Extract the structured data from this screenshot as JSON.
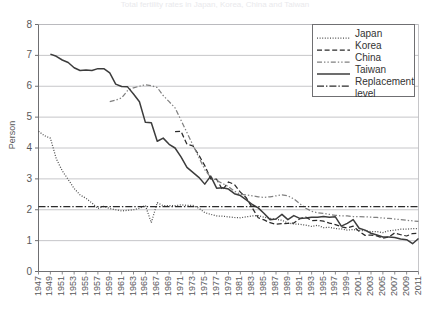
{
  "title": "Total fertility rates in Japan, Korea, China and Taiwan",
  "axes": {
    "ylabel": "Person",
    "yticks": [
      "0",
      "1",
      "2",
      "3",
      "4",
      "5",
      "6",
      "7",
      "8"
    ],
    "ylim": [
      0,
      8
    ],
    "xlim": [
      1947,
      2011
    ],
    "xticks": [
      "1947",
      "1949",
      "1951",
      "1953",
      "1955",
      "1957",
      "1959",
      "1961",
      "1963",
      "1965",
      "1967",
      "1969",
      "1971",
      "1973",
      "1975",
      "1977",
      "1979",
      "1981",
      "1983",
      "1985",
      "1987",
      "1989",
      "1991",
      "1993",
      "1995",
      "1997",
      "1999",
      "2001",
      "2003",
      "2005",
      "2007",
      "2009",
      "2011"
    ]
  },
  "legend": {
    "position": "top-right",
    "entries": [
      {
        "label": "Japan",
        "style": "dotted",
        "color": "#4d4d4d"
      },
      {
        "label": "Korea",
        "style": "dashed",
        "color": "#2b2b2b"
      },
      {
        "label": "China",
        "style": "dashdotdot",
        "color": "#808080"
      },
      {
        "label": "Taiwan",
        "style": "solid",
        "color": "#3c3c3c"
      },
      {
        "label": "Replacement",
        "style": "dashdot",
        "color": "#2b2b2b"
      }
    ],
    "continuation": "level"
  },
  "chart_data": {
    "type": "line",
    "title": "Total fertility rates in Japan, Korea, China and Taiwan",
    "xlabel": "",
    "ylabel": "Person",
    "ylim": [
      0,
      8
    ],
    "xlim": [
      1947,
      2011
    ],
    "grid": true,
    "legend_position": "top-right",
    "x": [
      1947,
      1948,
      1949,
      1950,
      1951,
      1952,
      1953,
      1954,
      1955,
      1956,
      1957,
      1958,
      1959,
      1960,
      1961,
      1962,
      1963,
      1964,
      1965,
      1966,
      1967,
      1968,
      1969,
      1970,
      1971,
      1972,
      1973,
      1974,
      1975,
      1976,
      1977,
      1978,
      1979,
      1980,
      1981,
      1982,
      1983,
      1984,
      1985,
      1986,
      1987,
      1988,
      1989,
      1990,
      1991,
      1992,
      1993,
      1994,
      1995,
      1996,
      1997,
      1998,
      1999,
      2000,
      2001,
      2002,
      2003,
      2004,
      2005,
      2006,
      2007,
      2008,
      2009,
      2010,
      2011
    ],
    "series": [
      {
        "name": "Japan",
        "style": "dotted",
        "color": "#4d4d4d",
        "values": [
          4.54,
          4.4,
          4.32,
          3.65,
          3.26,
          2.98,
          2.69,
          2.48,
          2.37,
          2.22,
          2.04,
          2.11,
          2.04,
          2.0,
          1.96,
          1.98,
          2.0,
          2.05,
          2.14,
          1.58,
          2.23,
          2.13,
          2.13,
          2.13,
          2.16,
          2.14,
          2.14,
          2.05,
          1.91,
          1.85,
          1.8,
          1.79,
          1.77,
          1.75,
          1.74,
          1.77,
          1.8,
          1.81,
          1.76,
          1.72,
          1.69,
          1.66,
          1.57,
          1.54,
          1.53,
          1.5,
          1.46,
          1.5,
          1.42,
          1.43,
          1.39,
          1.38,
          1.34,
          1.36,
          1.33,
          1.32,
          1.29,
          1.29,
          1.26,
          1.32,
          1.34,
          1.37,
          1.37,
          1.39,
          1.39
        ]
      },
      {
        "name": "Korea",
        "style": "dashed",
        "color": "#2b2b2b",
        "values": [
          null,
          null,
          null,
          null,
          null,
          null,
          null,
          null,
          null,
          null,
          null,
          null,
          null,
          null,
          null,
          null,
          null,
          null,
          null,
          null,
          null,
          null,
          null,
          4.53,
          4.54,
          4.12,
          4.07,
          3.77,
          3.43,
          3.0,
          2.99,
          2.64,
          2.9,
          2.82,
          2.57,
          2.39,
          2.06,
          1.74,
          1.67,
          1.58,
          1.53,
          1.55,
          1.56,
          1.57,
          1.71,
          1.76,
          1.65,
          1.66,
          1.63,
          1.57,
          1.52,
          1.45,
          1.41,
          1.47,
          1.3,
          1.17,
          1.18,
          1.15,
          1.08,
          1.12,
          1.25,
          1.19,
          1.15,
          1.23,
          1.24
        ]
      },
      {
        "name": "China",
        "style": "dashdotdot",
        "color": "#808080",
        "values": [
          null,
          null,
          null,
          null,
          null,
          null,
          null,
          null,
          null,
          null,
          null,
          null,
          5.5,
          5.55,
          5.62,
          5.86,
          5.95,
          6.0,
          6.05,
          6.02,
          5.96,
          5.7,
          5.5,
          5.3,
          4.9,
          4.5,
          4.1,
          3.7,
          3.3,
          3.05,
          2.95,
          2.85,
          2.75,
          2.6,
          2.5,
          2.48,
          2.45,
          2.42,
          2.4,
          2.42,
          2.45,
          2.48,
          2.45,
          2.35,
          2.2,
          2.05,
          1.95,
          1.9,
          1.88,
          1.85,
          1.82,
          1.8,
          1.8,
          1.78,
          1.78,
          1.77,
          1.76,
          1.75,
          1.73,
          1.72,
          1.7,
          1.68,
          1.66,
          1.64,
          1.62
        ]
      },
      {
        "name": "Taiwan",
        "style": "solid",
        "color": "#3c3c3c",
        "values": [
          null,
          null,
          7.04,
          6.97,
          6.85,
          6.77,
          6.6,
          6.51,
          6.53,
          6.51,
          6.57,
          6.57,
          6.43,
          6.07,
          5.99,
          5.98,
          5.75,
          5.5,
          4.83,
          4.82,
          4.22,
          4.32,
          4.12,
          4.0,
          3.71,
          3.37,
          3.21,
          3.05,
          2.83,
          3.09,
          2.7,
          2.71,
          2.67,
          2.52,
          2.46,
          2.32,
          2.17,
          2.06,
          1.88,
          1.68,
          1.7,
          1.85,
          1.68,
          1.81,
          1.72,
          1.73,
          1.76,
          1.76,
          1.78,
          1.76,
          1.77,
          1.47,
          1.56,
          1.68,
          1.4,
          1.34,
          1.24,
          1.18,
          1.12,
          1.12,
          1.1,
          1.05,
          1.03,
          0.9,
          1.07
        ]
      },
      {
        "name": "Replacement level",
        "style": "dashdot",
        "color": "#2b2b2b",
        "values": [
          2.1,
          2.1,
          2.1,
          2.1,
          2.1,
          2.1,
          2.1,
          2.1,
          2.1,
          2.1,
          2.1,
          2.1,
          2.1,
          2.1,
          2.1,
          2.1,
          2.1,
          2.1,
          2.1,
          2.1,
          2.1,
          2.1,
          2.1,
          2.1,
          2.1,
          2.1,
          2.1,
          2.1,
          2.1,
          2.1,
          2.1,
          2.1,
          2.1,
          2.1,
          2.1,
          2.1,
          2.1,
          2.1,
          2.1,
          2.1,
          2.1,
          2.1,
          2.1,
          2.1,
          2.1,
          2.1,
          2.1,
          2.1,
          2.1,
          2.1,
          2.1,
          2.1,
          2.1,
          2.1,
          2.1,
          2.1,
          2.1,
          2.1,
          2.1,
          2.1,
          2.1,
          2.1,
          2.1,
          2.1,
          2.1
        ]
      }
    ]
  }
}
